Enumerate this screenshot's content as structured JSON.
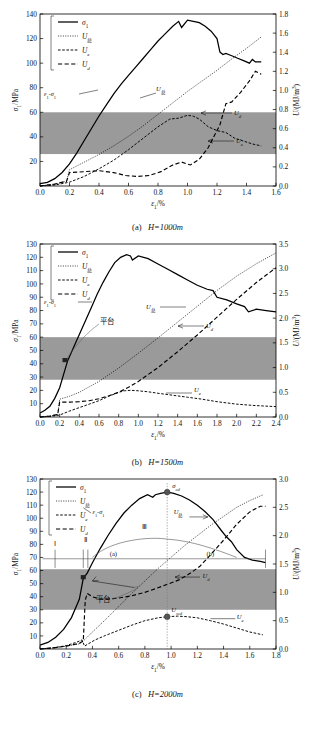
{
  "figure": {
    "legend_labels": [
      "σ₁",
      "U总",
      "U_e",
      "U_d"
    ],
    "legend_keys": [
      "sigma1",
      "Utotal",
      "Ue",
      "Ud"
    ],
    "axis_left_label": "σ₁/MPa",
    "axis_right_label": "U/(MJ/m³)",
    "axis_x_label": "ε₁/%",
    "band_label": "shaded-stress-band",
    "colors": {
      "band": "#9a9a9a",
      "line": "#000000",
      "marker": "#555555"
    }
  },
  "panels": [
    {
      "id": "a",
      "caption": "(a)  H=1000m",
      "caption_prefix": "(a)",
      "caption_body": "H=1000m",
      "xlabel": "ε₁/%",
      "ylabel_left": "σ₁/MPa",
      "ylabel_right": "U/(MJ/m³)",
      "xticks": [
        "0.0",
        "0.2",
        "0.4",
        "0.6",
        "0.8",
        "1.0",
        "1.2",
        "1.4",
        "1.6"
      ],
      "yticks_left": [
        "20",
        "40",
        "60",
        "80",
        "100",
        "120",
        "140"
      ],
      "yticks_right": [
        "0.0",
        "0.2",
        "0.4",
        "0.6",
        "0.8",
        "1.0",
        "1.2",
        "1.4",
        "1.6",
        "1.8"
      ],
      "xlim": [
        0,
        1.6
      ],
      "ylim_left": [
        0,
        140
      ],
      "ylim_right": [
        0,
        1.8
      ],
      "band_left": [
        26,
        60
      ],
      "annotations": [
        {
          "name": "curve-label-eps-sigma",
          "text": "ε₁-σ₁"
        },
        {
          "name": "curve-label-utotal",
          "text": "U总"
        },
        {
          "name": "curve-label-ud",
          "text": "U_d"
        },
        {
          "name": "curve-label-ue",
          "text": "U_e"
        }
      ]
    },
    {
      "id": "b",
      "caption": "(b)  H=1500m",
      "caption_prefix": "(b)",
      "caption_body": "H=1500m",
      "xlabel": "ε₁/%",
      "ylabel_left": "σ₁/MPa",
      "ylabel_right": "U/(MJ/m³)",
      "xticks": [
        "0.0",
        "0.2",
        "0.4",
        "0.6",
        "0.8",
        "1.0",
        "1.2",
        "1.4",
        "1.6",
        "1.8",
        "2.0",
        "2.2",
        "2.4"
      ],
      "yticks_left": [
        "10",
        "20",
        "30",
        "40",
        "50",
        "60",
        "70",
        "80",
        "90",
        "100",
        "110",
        "120",
        "130"
      ],
      "yticks_right": [
        "0.0",
        "0.5",
        "1.0",
        "1.5",
        "2.0",
        "2.5",
        "3.0",
        "3.5"
      ],
      "xlim": [
        0,
        2.4
      ],
      "ylim_left": [
        0,
        130
      ],
      "ylim_right": [
        0,
        3.5
      ],
      "band_left": [
        28,
        60
      ],
      "annotations": [
        {
          "name": "curve-label-eps-sigma",
          "text": "ε₁-σ₁"
        },
        {
          "name": "curve-label-utotal",
          "text": "U总"
        },
        {
          "name": "curve-label-ud",
          "text": "U_d"
        },
        {
          "name": "curve-label-ue",
          "text": "U_e"
        },
        {
          "name": "platform-label",
          "text": "平台"
        }
      ]
    },
    {
      "id": "c",
      "caption": "(c)  H=2000m",
      "caption_prefix": "(c)",
      "caption_body": "H=2000m",
      "xlabel": "ε₁/%",
      "ylabel_left": "σ₁/MPa",
      "ylabel_right": "U/(MJ/m³)",
      "xticks": [
        "0.0",
        "0.2",
        "0.4",
        "0.6",
        "0.8",
        "1.0",
        "1.2",
        "1.4",
        "1.6",
        "1.8"
      ],
      "yticks_left": [
        "10",
        "20",
        "30",
        "40",
        "50",
        "60",
        "70",
        "80",
        "90",
        "100",
        "110",
        "120",
        "130"
      ],
      "yticks_right": [
        "0.0",
        "0.5",
        "1.0",
        "1.5",
        "2.0",
        "2.5",
        "3.0"
      ],
      "xlim": [
        0,
        1.8
      ],
      "ylim_left": [
        0,
        130
      ],
      "ylim_right": [
        0,
        3.0
      ],
      "band_left": [
        30,
        61
      ],
      "annotations": [
        {
          "name": "curve-label-eps-sigma",
          "text": "ε₁-σ₁"
        },
        {
          "name": "curve-label-utotal",
          "text": "U总"
        },
        {
          "name": "curve-label-ud",
          "text": "U_d"
        },
        {
          "name": "curve-label-ue",
          "text": "U_e"
        },
        {
          "name": "platform-label",
          "text": "平台"
        },
        {
          "name": "stage-marker-1",
          "text": "Ⅰ"
        },
        {
          "name": "stage-marker-2",
          "text": "Ⅱ"
        },
        {
          "name": "stage-marker-3",
          "text": "Ⅲ"
        },
        {
          "name": "region-label-a",
          "text": "(a)"
        },
        {
          "name": "region-label-b",
          "text": "(b)"
        },
        {
          "name": "peak-label-sigma-cd",
          "text": "σ_cd"
        },
        {
          "name": "peak-label-u-scd",
          "text": "U_scd"
        }
      ]
    }
  ],
  "chart_data": [
    {
      "type": "line",
      "panel": "a",
      "title": "(a)  H=1000m",
      "xlabel": "ε₁/%",
      "ylabel": "σ₁/MPa",
      "ylabel_right": "U/(MJ/m³)",
      "xlim": [
        0,
        1.6
      ],
      "ylim": [
        0,
        140
      ],
      "ylim_right": [
        0,
        1.8
      ],
      "grid": false,
      "legend_position": "top-left",
      "shaded_band_left_axis": [
        26,
        60
      ],
      "series": [
        {
          "name": "σ₁",
          "axis": "left",
          "style": "solid",
          "x": [
            0.0,
            0.05,
            0.1,
            0.15,
            0.2,
            0.25,
            0.3,
            0.35,
            0.4,
            0.45,
            0.5,
            0.55,
            0.6,
            0.65,
            0.7,
            0.75,
            0.8,
            0.85,
            0.9,
            0.94,
            0.96,
            1.0,
            1.04,
            1.08,
            1.12,
            1.16,
            1.2,
            1.22,
            1.24,
            1.26,
            1.3,
            1.34,
            1.38,
            1.42,
            1.44,
            1.46,
            1.5
          ],
          "y": [
            2,
            3,
            6,
            11,
            18,
            27,
            37,
            47,
            57,
            66,
            75,
            83,
            90,
            97,
            104,
            111,
            118,
            124,
            130,
            134,
            129,
            135,
            134,
            133,
            130,
            126,
            120,
            109,
            107,
            108,
            106,
            104,
            102,
            100,
            103,
            101,
            101
          ]
        },
        {
          "name": "U总",
          "axis": "right",
          "style": "dotted",
          "x": [
            0.0,
            0.1,
            0.18,
            0.2,
            0.3,
            0.4,
            0.5,
            0.6,
            0.7,
            0.8,
            0.9,
            1.0,
            1.1,
            1.2,
            1.3,
            1.4,
            1.5
          ],
          "y": [
            0.0,
            0.02,
            0.05,
            0.17,
            0.25,
            0.33,
            0.42,
            0.52,
            0.63,
            0.75,
            0.87,
            0.99,
            1.1,
            1.21,
            1.33,
            1.44,
            1.56
          ]
        },
        {
          "name": "U_e",
          "axis": "right",
          "style": "dashed-fine",
          "x": [
            0.0,
            0.1,
            0.2,
            0.3,
            0.4,
            0.5,
            0.6,
            0.7,
            0.8,
            0.88,
            0.94,
            1.0,
            1.04,
            1.08,
            1.14,
            1.2,
            1.26,
            1.32,
            1.38,
            1.44,
            1.5
          ],
          "y": [
            0.0,
            0.01,
            0.04,
            0.1,
            0.18,
            0.27,
            0.38,
            0.5,
            0.62,
            0.7,
            0.71,
            0.74,
            0.73,
            0.7,
            0.62,
            0.58,
            0.56,
            0.5,
            0.47,
            0.44,
            0.42
          ]
        },
        {
          "name": "U_d",
          "axis": "right",
          "style": "dashed-coarse",
          "x": [
            0.0,
            0.1,
            0.18,
            0.2,
            0.3,
            0.4,
            0.5,
            0.58,
            0.66,
            0.74,
            0.82,
            0.9,
            0.96,
            1.02,
            1.08,
            1.14,
            1.18,
            1.22,
            1.26,
            1.3,
            1.36,
            1.42,
            1.46,
            1.5
          ],
          "y": [
            0.0,
            0.02,
            0.05,
            0.14,
            0.15,
            0.16,
            0.14,
            0.11,
            0.1,
            0.11,
            0.15,
            0.22,
            0.25,
            0.22,
            0.28,
            0.4,
            0.52,
            0.64,
            0.86,
            0.88,
            0.98,
            1.1,
            1.2,
            1.17
          ]
        }
      ]
    },
    {
      "type": "line",
      "panel": "b",
      "title": "(b)  H=1500m",
      "xlabel": "ε₁/%",
      "ylabel": "σ₁/MPa",
      "ylabel_right": "U/(MJ/m³)",
      "xlim": [
        0,
        2.4
      ],
      "ylim": [
        0,
        130
      ],
      "ylim_right": [
        0,
        3.5
      ],
      "grid": false,
      "legend_position": "top-left",
      "shaded_band_left_axis": [
        28,
        60
      ],
      "series": [
        {
          "name": "σ₁",
          "axis": "left",
          "style": "solid",
          "x": [
            0.0,
            0.05,
            0.1,
            0.15,
            0.2,
            0.24,
            0.28,
            0.34,
            0.4,
            0.46,
            0.52,
            0.58,
            0.64,
            0.7,
            0.76,
            0.82,
            0.88,
            0.92,
            0.94,
            1.0,
            1.1,
            1.2,
            1.3,
            1.4,
            1.5,
            1.6,
            1.7,
            1.76,
            1.8,
            1.9,
            2.0,
            2.08,
            2.12,
            2.2,
            2.3,
            2.4
          ],
          "y": [
            3,
            5,
            8,
            14,
            22,
            32,
            42,
            52,
            62,
            72,
            82,
            92,
            101,
            109,
            116,
            120,
            122,
            121,
            118,
            121,
            119,
            115,
            111,
            107,
            103,
            99,
            96,
            95,
            90,
            88,
            85,
            83,
            79,
            81,
            80,
            79
          ]
        },
        {
          "name": "U总",
          "axis": "right",
          "style": "dotted",
          "x": [
            0.0,
            0.1,
            0.18,
            0.2,
            0.3,
            0.4,
            0.6,
            0.8,
            1.0,
            1.2,
            1.4,
            1.6,
            1.8,
            2.0,
            2.2,
            2.4
          ],
          "y": [
            0.0,
            0.02,
            0.05,
            0.36,
            0.42,
            0.5,
            0.72,
            0.99,
            1.29,
            1.6,
            1.92,
            2.24,
            2.56,
            2.85,
            3.1,
            3.32
          ]
        },
        {
          "name": "U_e",
          "axis": "right",
          "style": "dashed-fine",
          "x": [
            0.0,
            0.1,
            0.2,
            0.3,
            0.4,
            0.5,
            0.6,
            0.7,
            0.8,
            0.86,
            0.92,
            1.0,
            1.1,
            1.2,
            1.35,
            1.5,
            1.65,
            1.8,
            2.0,
            2.2,
            2.4
          ],
          "y": [
            0.0,
            0.01,
            0.04,
            0.12,
            0.19,
            0.26,
            0.33,
            0.42,
            0.5,
            0.53,
            0.54,
            0.53,
            0.51,
            0.48,
            0.44,
            0.4,
            0.36,
            0.31,
            0.26,
            0.23,
            0.21
          ]
        },
        {
          "name": "U_d",
          "axis": "right",
          "style": "dashed-coarse",
          "x": [
            0.0,
            0.1,
            0.18,
            0.2,
            0.3,
            0.4,
            0.5,
            0.6,
            0.7,
            0.8,
            0.9,
            1.0,
            1.2,
            1.4,
            1.6,
            1.8,
            2.0,
            2.2,
            2.4
          ],
          "y": [
            0.0,
            0.02,
            0.05,
            0.3,
            0.3,
            0.31,
            0.33,
            0.37,
            0.43,
            0.5,
            0.6,
            0.72,
            1.0,
            1.32,
            1.66,
            2.02,
            2.38,
            2.72,
            3.02
          ]
        }
      ]
    },
    {
      "type": "line",
      "panel": "c",
      "title": "(c)  H=2000m",
      "xlabel": "ε₁/%",
      "ylabel": "σ₁/MPa",
      "ylabel_right": "U/(MJ/m³)",
      "xlim": [
        0,
        1.8
      ],
      "ylim": [
        0,
        130
      ],
      "ylim_right": [
        0,
        3.0
      ],
      "grid": false,
      "legend_position": "top-left",
      "shaded_band_left_axis": [
        30,
        61
      ],
      "markers": [
        {
          "name": "σ_cd",
          "x": 0.97,
          "y_left": 120
        },
        {
          "name": "U_scd",
          "x": 0.97,
          "y_right": 0.57
        }
      ],
      "series": [
        {
          "name": "σ₁",
          "axis": "left",
          "style": "solid",
          "x": [
            0.0,
            0.06,
            0.12,
            0.18,
            0.24,
            0.3,
            0.33,
            0.36,
            0.4,
            0.46,
            0.52,
            0.58,
            0.64,
            0.7,
            0.76,
            0.82,
            0.86,
            0.88,
            0.92,
            0.97,
            1.02,
            1.08,
            1.14,
            1.2,
            1.26,
            1.32,
            1.38,
            1.42,
            1.46,
            1.5,
            1.56,
            1.62,
            1.68,
            1.72
          ],
          "y": [
            3,
            5,
            9,
            15,
            24,
            38,
            54,
            58,
            66,
            77,
            87,
            96,
            104,
            110,
            115,
            118,
            116,
            118,
            119,
            120,
            119,
            117,
            114,
            110,
            105,
            99,
            91,
            86,
            82,
            76,
            70,
            68,
            67,
            66
          ]
        },
        {
          "name": "U总",
          "axis": "right",
          "style": "dotted",
          "x": [
            0.0,
            0.1,
            0.2,
            0.3,
            0.33,
            0.4,
            0.5,
            0.6,
            0.7,
            0.8,
            0.9,
            0.97,
            1.1,
            1.2,
            1.3,
            1.4,
            1.5,
            1.6,
            1.7
          ],
          "y": [
            0.0,
            0.02,
            0.05,
            0.09,
            0.14,
            0.3,
            0.52,
            0.75,
            0.98,
            1.2,
            1.42,
            1.56,
            1.82,
            2.0,
            2.18,
            2.34,
            2.5,
            2.62,
            2.72
          ]
        },
        {
          "name": "U_e",
          "axis": "right",
          "style": "dashed-fine",
          "x": [
            0.0,
            0.1,
            0.2,
            0.28,
            0.32,
            0.34,
            0.36,
            0.42,
            0.5,
            0.6,
            0.7,
            0.8,
            0.9,
            0.97,
            1.05,
            1.12,
            1.2,
            1.3,
            1.4,
            1.5,
            1.6,
            1.7
          ],
          "y": [
            0.0,
            0.02,
            0.06,
            0.12,
            0.16,
            0.05,
            0.08,
            0.16,
            0.24,
            0.33,
            0.42,
            0.5,
            0.55,
            0.57,
            0.58,
            0.57,
            0.55,
            0.5,
            0.44,
            0.37,
            0.3,
            0.25
          ]
        },
        {
          "name": "U_d",
          "axis": "right",
          "style": "dashed-coarse",
          "x": [
            0.0,
            0.1,
            0.2,
            0.3,
            0.33,
            0.345,
            0.36,
            0.4,
            0.46,
            0.52,
            0.6,
            0.7,
            0.8,
            0.9,
            0.97,
            1.06,
            1.12,
            1.16,
            1.22,
            1.3,
            1.4,
            1.5,
            1.6,
            1.68,
            1.72
          ],
          "y": [
            0.0,
            0.02,
            0.05,
            0.1,
            0.14,
            0.86,
            0.98,
            0.92,
            0.88,
            0.88,
            0.9,
            0.94,
            1.0,
            1.08,
            1.14,
            1.22,
            1.3,
            1.36,
            1.46,
            1.66,
            1.92,
            2.2,
            2.42,
            2.52,
            2.52
          ]
        }
      ]
    }
  ]
}
